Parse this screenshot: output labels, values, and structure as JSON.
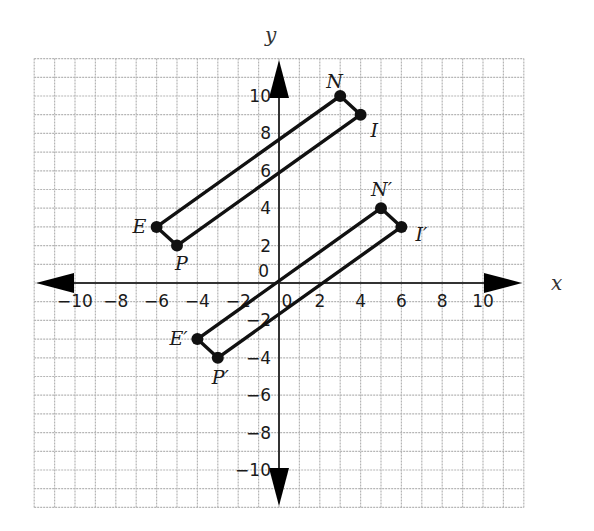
{
  "chart_data": {
    "type": "scatter",
    "title": "",
    "xlabel": "x",
    "ylabel": "y",
    "xlim": [
      -12,
      12
    ],
    "ylim": [
      -12,
      12
    ],
    "grid": true,
    "x_ticks": [
      -10,
      -8,
      -6,
      -4,
      -2,
      0,
      2,
      4,
      6,
      8,
      10
    ],
    "y_ticks": [
      -10,
      -8,
      -6,
      -4,
      -2,
      0,
      2,
      4,
      6,
      8,
      10
    ],
    "x_tick_labels": [
      "−10",
      "−8",
      "−6",
      "−4",
      "−2",
      "0",
      "2",
      "4",
      "6",
      "8",
      "10"
    ],
    "y_tick_labels": [
      "−10",
      "−8",
      "−6",
      "−4",
      "−2",
      "0",
      "2",
      "4",
      "6",
      "8",
      "10"
    ],
    "series": [
      {
        "name": "PENI",
        "closed": true,
        "points": [
          {
            "label": "P",
            "x": -5,
            "y": 2
          },
          {
            "label": "E",
            "x": -6,
            "y": 3
          },
          {
            "label": "N",
            "x": 3,
            "y": 10
          },
          {
            "label": "I",
            "x": 4,
            "y": 9
          }
        ]
      },
      {
        "name": "P'E'N'I'",
        "closed": true,
        "points": [
          {
            "label": "P′",
            "x": -3,
            "y": -4
          },
          {
            "label": "E′",
            "x": -4,
            "y": -3
          },
          {
            "label": "N′",
            "x": 5,
            "y": 4
          },
          {
            "label": "I′",
            "x": 6,
            "y": 3
          }
        ]
      }
    ]
  },
  "axes": {
    "x_label": "x",
    "y_label": "y"
  },
  "colors": {
    "grid": "#b5b5b5",
    "axis": "#333333",
    "shape": "#111111"
  }
}
